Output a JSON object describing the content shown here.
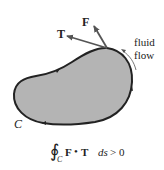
{
  "diagram": {
    "region_fill": "#b4b4b4",
    "curve_color": "#222222",
    "curve_label": "C",
    "vectors": [
      {
        "name": "F",
        "label": "F"
      },
      {
        "name": "T",
        "label": "T"
      }
    ],
    "flow_label_line1": "fluid",
    "flow_label_line2": "flow",
    "formula": {
      "integral_symbol": "∮",
      "subscript": "C",
      "integrand_F": "F",
      "dot": "•",
      "integrand_T": "T",
      "differential": "ds",
      "relation": "> 0"
    }
  }
}
